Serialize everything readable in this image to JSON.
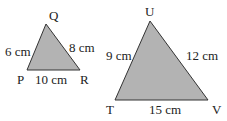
{
  "triangles": [
    {
      "name": "PQR",
      "vertices": {
        "P": "P",
        "Q": "Q",
        "R": "R"
      },
      "sides": {
        "PQ": "6 cm",
        "QR": "8 cm",
        "PR": "10 cm"
      }
    },
    {
      "name": "TUV",
      "vertices": {
        "T": "T",
        "U": "U",
        "V": "V"
      },
      "sides": {
        "TU": "9 cm",
        "UV": "12 cm",
        "TV": "15 cm"
      }
    }
  ],
  "colors": {
    "fill": "#b3b3b3",
    "stroke": "#333333"
  }
}
